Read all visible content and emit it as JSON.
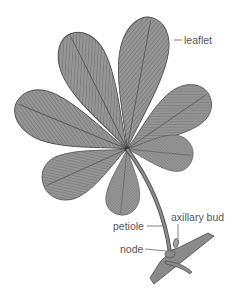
{
  "diagram": {
    "colors": {
      "leaflet_fill": "#8f8f8f",
      "outline": "#4a4a4a",
      "vein": "#6a6a6a",
      "stem": "#7a7a7a",
      "label_text": "#555555",
      "leader_line": "#666666"
    },
    "labels": {
      "leaflet": "leaflet",
      "petiole": "petiole",
      "axillary_bud": "axillary bud",
      "node": "node"
    }
  }
}
